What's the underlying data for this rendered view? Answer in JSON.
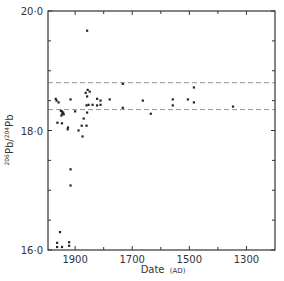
{
  "chart_data": {
    "type": "scatter",
    "title": "",
    "xlabel": "Date (AD)",
    "xlabel_main": "Date",
    "xlabel_unit": "(AD)",
    "ylabel": "206Pb/204Pb",
    "ylabel_parts": {
      "sup1": "206",
      "base1": "Pb/",
      "sup2": "204",
      "base2": "Pb"
    },
    "xlim": [
      1995,
      1200
    ],
    "ylim": [
      16.0,
      20.0
    ],
    "x_reversed": true,
    "grid": false,
    "legend": null,
    "x_ticks_major": [
      1900,
      1700,
      1500,
      1300
    ],
    "x_ticks_minor": [
      1800,
      1600,
      1400
    ],
    "x_tick_labels": [
      "1900",
      "1700",
      "1500",
      "1300"
    ],
    "y_ticks_major": [
      16.0,
      18.0,
      20.0
    ],
    "y_ticks_minor": [
      16.5,
      17.0,
      17.5,
      18.5,
      19.0,
      19.5
    ],
    "y_tick_labels": [
      "16·0",
      "18·0",
      "20·0"
    ],
    "reference_lines": [
      {
        "orientation": "horizontal",
        "y": 18.8,
        "style": "dashed"
      },
      {
        "orientation": "horizontal",
        "y": 18.35,
        "style": "dashed"
      }
    ],
    "series": [
      {
        "name": "samples",
        "points": [
          {
            "x": 1858,
            "y": 19.67
          },
          {
            "x": 1968,
            "y": 18.53
          },
          {
            "x": 1965,
            "y": 18.5
          },
          {
            "x": 1958,
            "y": 18.47
          },
          {
            "x": 1916,
            "y": 18.52
          },
          {
            "x": 1950,
            "y": 18.33
          },
          {
            "x": 1946,
            "y": 18.32
          },
          {
            "x": 1942,
            "y": 18.3
          },
          {
            "x": 1945,
            "y": 18.28
          },
          {
            "x": 1940,
            "y": 18.27
          },
          {
            "x": 1948,
            "y": 18.25
          },
          {
            "x": 1962,
            "y": 18.13
          },
          {
            "x": 1946,
            "y": 18.12
          },
          {
            "x": 1925,
            "y": 18.05
          },
          {
            "x": 1888,
            "y": 18.0
          },
          {
            "x": 1926,
            "y": 18.02
          },
          {
            "x": 1856,
            "y": 18.68
          },
          {
            "x": 1849,
            "y": 18.65
          },
          {
            "x": 1863,
            "y": 18.63
          },
          {
            "x": 1858,
            "y": 18.57
          },
          {
            "x": 1823,
            "y": 18.53
          },
          {
            "x": 1811,
            "y": 18.5
          },
          {
            "x": 1779,
            "y": 18.52
          },
          {
            "x": 1733,
            "y": 18.78
          },
          {
            "x": 1860,
            "y": 18.42
          },
          {
            "x": 1853,
            "y": 18.43
          },
          {
            "x": 1839,
            "y": 18.43
          },
          {
            "x": 1823,
            "y": 18.42
          },
          {
            "x": 1811,
            "y": 18.43
          },
          {
            "x": 1900,
            "y": 18.32
          },
          {
            "x": 1858,
            "y": 18.3
          },
          {
            "x": 1733,
            "y": 18.38
          },
          {
            "x": 1870,
            "y": 18.2
          },
          {
            "x": 1877,
            "y": 18.08
          },
          {
            "x": 1860,
            "y": 18.08
          },
          {
            "x": 1874,
            "y": 17.9
          },
          {
            "x": 1663,
            "y": 18.5
          },
          {
            "x": 1635,
            "y": 18.28
          },
          {
            "x": 1558,
            "y": 18.52
          },
          {
            "x": 1558,
            "y": 18.42
          },
          {
            "x": 1505,
            "y": 18.52
          },
          {
            "x": 1484,
            "y": 18.72
          },
          {
            "x": 1484,
            "y": 18.47
          },
          {
            "x": 1347,
            "y": 18.4
          },
          {
            "x": 1916,
            "y": 17.35
          },
          {
            "x": 1916,
            "y": 17.08
          },
          {
            "x": 1953,
            "y": 16.3
          },
          {
            "x": 1963,
            "y": 16.12
          },
          {
            "x": 1963,
            "y": 16.05
          },
          {
            "x": 1946,
            "y": 16.05
          },
          {
            "x": 1921,
            "y": 16.13
          },
          {
            "x": 1921,
            "y": 16.07
          }
        ]
      }
    ]
  },
  "colors": {
    "axis": "#333333",
    "points": "#222222",
    "reference_line": "#8a8a8a",
    "background": "#ffffff"
  }
}
